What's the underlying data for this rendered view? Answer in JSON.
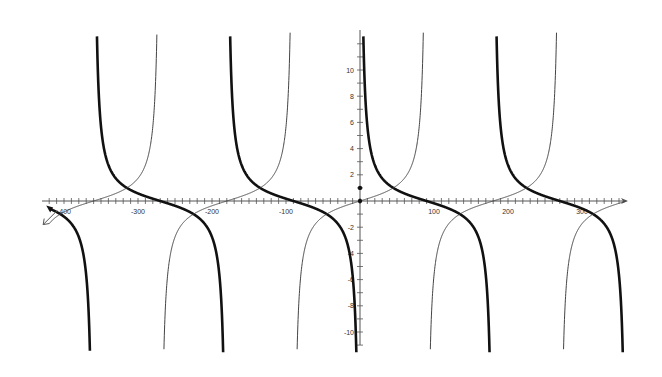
{
  "chart_data": {
    "type": "line",
    "title": "",
    "xlabel": "",
    "ylabel": "",
    "x_unit": "degrees",
    "xlim": [
      -430,
      365
    ],
    "ylim": [
      -11.5,
      12.5
    ],
    "grid": false,
    "legend": "none",
    "x_tick_labels": [
      "-400",
      "-300",
      "-200",
      "-100",
      "100",
      "200",
      "300"
    ],
    "x_tick_values": [
      -400,
      -300,
      -200,
      -100,
      100,
      200,
      300
    ],
    "x_minor_step": 10,
    "y_tick_labels": [
      "10",
      "8",
      "6",
      "4",
      "2",
      "-2",
      "-4",
      "-6",
      "-8",
      "-10"
    ],
    "y_tick_values": [
      10,
      8,
      6,
      4,
      2,
      -2,
      -4,
      -6,
      -8,
      -10
    ],
    "y_minor_step": 1,
    "series": [
      {
        "name": "cot(x)",
        "style": "thick",
        "color": "#111111",
        "width": 2.6,
        "function": "cot",
        "domain": [
          -420,
          360
        ],
        "asymptotes": [
          -360,
          -180,
          0,
          180,
          360
        ],
        "sample_points": [
          [
            -420,
            -0.58
          ],
          [
            -390,
            -1.73
          ],
          [
            -300,
            0.58
          ],
          [
            -270,
            0
          ],
          [
            -225,
            -1
          ],
          [
            -135,
            1
          ],
          [
            -90,
            0
          ],
          [
            -45,
            -1
          ],
          [
            45,
            1
          ],
          [
            90,
            0
          ],
          [
            135,
            -1
          ],
          [
            225,
            1
          ],
          [
            270,
            0
          ],
          [
            315,
            -1
          ]
        ]
      },
      {
        "name": "tan(x)",
        "style": "thin",
        "color": "#444444",
        "width": 1.0,
        "function": "tan",
        "domain": [
          -420,
          360
        ],
        "asymptotes": [
          -270,
          -90,
          90,
          270
        ],
        "sample_points": [
          [
            -420,
            -1.73
          ],
          [
            -360,
            0
          ],
          [
            -315,
            1
          ],
          [
            -225,
            -1
          ],
          [
            -180,
            0
          ],
          [
            -135,
            1
          ],
          [
            -45,
            -1
          ],
          [
            0,
            0
          ],
          [
            45,
            1
          ],
          [
            135,
            -1
          ],
          [
            180,
            0
          ],
          [
            225,
            1
          ],
          [
            315,
            -1
          ],
          [
            360,
            0
          ]
        ]
      }
    ],
    "markers": [
      [
        0,
        1
      ],
      [
        0,
        0
      ]
    ]
  },
  "layout": {
    "origin_px": [
      360,
      201
    ],
    "px_per_degree": 0.74,
    "px_per_unit": 13.1,
    "x_axis_px": [
      42,
      628
    ],
    "y_axis_px": [
      30,
      345
    ],
    "curve_clip_px": [
      30,
      355
    ]
  }
}
